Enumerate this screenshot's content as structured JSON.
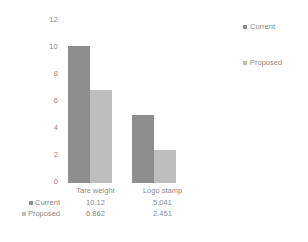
{
  "chart_data": {
    "type": "bar",
    "title": "",
    "xlabel": "",
    "ylabel": "",
    "ylim": [
      0,
      12
    ],
    "yticks": [
      "0",
      "2",
      "4",
      "6",
      "8",
      "10",
      "12"
    ],
    "grid": false,
    "legend_position": "right",
    "categories": [
      "Tare weight",
      "Logo stamp"
    ],
    "series": [
      {
        "name": "Current",
        "color": "#8d8d8d",
        "values": [
          10.12,
          5.041
        ],
        "labels": [
          "10.12",
          "5.041"
        ]
      },
      {
        "name": "Proposed",
        "color": "#bdbdbd",
        "values": [
          6.862,
          2.451
        ],
        "labels": [
          "6.862",
          "2.451"
        ]
      }
    ]
  },
  "legend": {
    "items": [
      {
        "label": "Current",
        "marker": "square-marker",
        "color": "#8d8d8d"
      },
      {
        "label": "Proposed",
        "marker": "square-marker",
        "color": "#bdbdbd"
      }
    ]
  },
  "data_table": {
    "column_headers": [
      "Tare weight",
      "Logo stamp"
    ],
    "rows": [
      {
        "name": "Current",
        "marker": "square-marker",
        "values": [
          "10.12",
          "5.041"
        ]
      },
      {
        "name": "Proposed",
        "marker": "square-marker",
        "values": [
          "6.862",
          "2.451"
        ]
      }
    ]
  },
  "axis": {
    "y_tick_labels": [
      "12",
      "10",
      "8",
      "6",
      "4",
      "2",
      "0"
    ]
  }
}
